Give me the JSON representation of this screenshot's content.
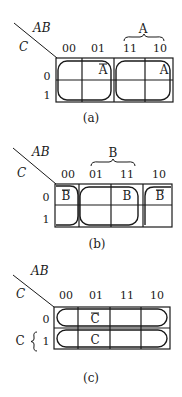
{
  "figures": [
    {
      "id": "a",
      "caption": "(a)",
      "corner_top": "AB",
      "corner_left": "C",
      "col_headers": [
        "00",
        "01",
        "11",
        "10"
      ],
      "row_headers": [
        "0",
        "1"
      ],
      "brace_label": "A",
      "cell_labels": [
        {
          "row": 0,
          "col": 1,
          "text": "A",
          "overbar": true
        },
        {
          "row": 0,
          "col": 3,
          "text": "A",
          "overbar": false
        }
      ],
      "groups": [
        "columns 00-01 (Ā)",
        "columns 11-10 (A)"
      ]
    },
    {
      "id": "b",
      "caption": "(b)",
      "corner_top": "AB",
      "corner_left": "C",
      "col_headers": [
        "00",
        "01",
        "11",
        "10"
      ],
      "row_headers": [
        "0",
        "1"
      ],
      "brace_label": "B",
      "cell_labels": [
        {
          "row": 0,
          "col": 0,
          "text": "B",
          "overbar": true
        },
        {
          "row": 0,
          "col": 2,
          "text": "B",
          "overbar": false
        },
        {
          "row": 0,
          "col": 3,
          "text": "B",
          "overbar": true
        }
      ],
      "groups": [
        "columns 01-11 (B)",
        "columns 00 and 10 wrap-around (B̄)"
      ]
    },
    {
      "id": "c",
      "caption": "(c)",
      "corner_top": "AB",
      "corner_left": "C",
      "col_headers": [
        "00",
        "01",
        "11",
        "10"
      ],
      "row_headers": [
        "0",
        "1"
      ],
      "row_brace_label": "C",
      "cell_labels": [
        {
          "row": 0,
          "col": 1,
          "text": "C",
          "overbar": true
        },
        {
          "row": 1,
          "col": 1,
          "text": "C",
          "overbar": false
        }
      ],
      "groups": [
        "row 0 (C̄)",
        "row 1 (C)"
      ]
    }
  ]
}
